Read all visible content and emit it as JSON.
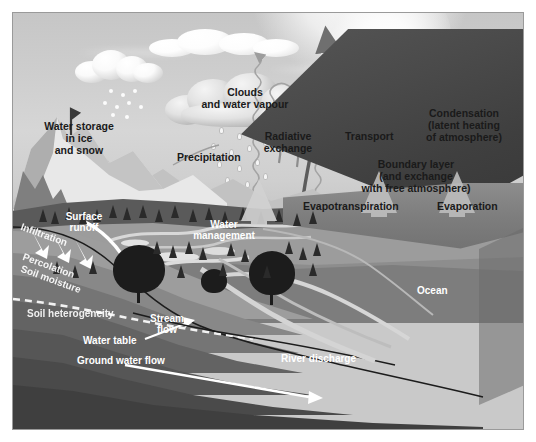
{
  "figure": {
    "type": "water-cycle-diagram",
    "palette": {
      "background": "#ffffff",
      "frame_border": "#9a9a9a",
      "sky": "#cfcfcf",
      "ocean": "#3f3f3f",
      "land": "#7a7a7a",
      "soil_dark": "#4e4e4e",
      "cloud_light": "#ffffff",
      "cloud_shadow": "#9a9a9a",
      "label_dark": "#1a1a1a",
      "label_light": "#ffffff",
      "arrow_light": "#d9d9d9",
      "arrow_dark": "#6e6e6e",
      "water": "#d9d9d9"
    }
  },
  "labels": {
    "clouds": "Clouds\nand water vapour",
    "precipitation": "Precipitation",
    "water_storage": "Water storage\nin ice\nand snow",
    "radiative_exchange": "Radiative\nexchange",
    "transport": "Transport",
    "condensation": "Condensation\n(latent heating\nof atmosphere)",
    "boundary_layer": "Boundary layer\n(and exchange\nwith free atmosphere)",
    "evapotranspiration": "Evapotranspiration",
    "evaporation": "Evaporation",
    "surface_runoff": "Surface\nrunoff",
    "infiltration": "Infiltration",
    "percolation": "Percolation",
    "soil_moisture": "Soil moisture",
    "soil_heterogeneity": "Soil heterogeneity",
    "water_table": "Water table",
    "ground_water_flow": "Ground water flow",
    "water_management": "Water\nmanagement",
    "stream_flow": "Stream\nflow",
    "river_discharge": "River discharge",
    "ocean": "Ocean"
  },
  "processes": [
    {
      "name": "clouds-and-water-vapour",
      "label": "Clouds and water vapour",
      "domain": "atmosphere"
    },
    {
      "name": "precipitation",
      "label": "Precipitation",
      "domain": "atmosphere-to-surface"
    },
    {
      "name": "water-storage-in-ice-and-snow",
      "label": "Water storage in ice and snow",
      "domain": "cryosphere"
    },
    {
      "name": "radiative-exchange",
      "label": "Radiative exchange",
      "domain": "energy"
    },
    {
      "name": "transport",
      "label": "Transport",
      "domain": "atmosphere"
    },
    {
      "name": "condensation",
      "label": "Condensation (latent heating of atmosphere)",
      "domain": "atmosphere"
    },
    {
      "name": "boundary-layer",
      "label": "Boundary layer (and exchange with free atmosphere)",
      "domain": "atmosphere"
    },
    {
      "name": "evapotranspiration",
      "label": "Evapotranspiration",
      "domain": "surface-to-atmosphere"
    },
    {
      "name": "evaporation",
      "label": "Evaporation",
      "domain": "ocean-to-atmosphere"
    },
    {
      "name": "surface-runoff",
      "label": "Surface runoff",
      "domain": "land"
    },
    {
      "name": "infiltration",
      "label": "Infiltration",
      "domain": "subsurface"
    },
    {
      "name": "percolation",
      "label": "Percolation",
      "domain": "subsurface"
    },
    {
      "name": "soil-moisture",
      "label": "Soil moisture",
      "domain": "subsurface"
    },
    {
      "name": "soil-heterogeneity",
      "label": "Soil heterogeneity",
      "domain": "subsurface"
    },
    {
      "name": "water-table",
      "label": "Water table",
      "domain": "subsurface"
    },
    {
      "name": "ground-water-flow",
      "label": "Ground water flow",
      "domain": "subsurface"
    },
    {
      "name": "water-management",
      "label": "Water management",
      "domain": "land"
    },
    {
      "name": "stream-flow",
      "label": "Stream flow",
      "domain": "surface-water"
    },
    {
      "name": "river-discharge",
      "label": "River discharge",
      "domain": "surface-water"
    },
    {
      "name": "ocean",
      "label": "Ocean",
      "domain": "ocean"
    }
  ]
}
